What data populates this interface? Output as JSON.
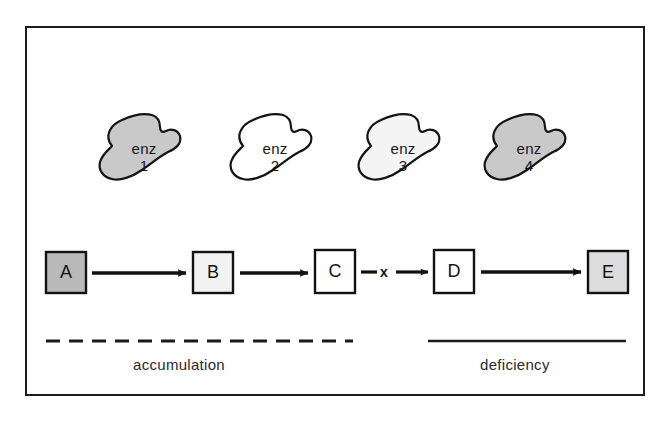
{
  "figure": {
    "type": "metabolic-pathway-diagram",
    "title": "",
    "frame": {
      "border_color": "#1c1c1c"
    }
  },
  "enzymes": [
    {
      "label": "enz",
      "number": "1",
      "fill": "#c9c9c9",
      "state": "active"
    },
    {
      "label": "enz",
      "number": "2",
      "fill": "#ffffff",
      "state": "active"
    },
    {
      "label": "enz",
      "number": "3",
      "fill": "#f4f4f4",
      "state": "deficient"
    },
    {
      "label": "enz",
      "number": "4",
      "fill": "#c9c9c9",
      "state": "active"
    }
  ],
  "metabolites": [
    {
      "label": "A",
      "fill": "#b9b9b9"
    },
    {
      "label": "B",
      "fill": "#f2f2f2"
    },
    {
      "label": "C",
      "fill": "#ffffff"
    },
    {
      "label": "D",
      "fill": "#ffffff"
    },
    {
      "label": "E",
      "fill": "#dcdcdc"
    }
  ],
  "block": {
    "symbol": "x",
    "between": "C-D"
  },
  "annotations": [
    {
      "text": "accumulation",
      "line_style": "dashed"
    },
    {
      "text": "deficiency",
      "line_style": "solid"
    }
  ],
  "colors": {
    "ink": "#1c1c1c",
    "blob_gray": "#c9c9c9",
    "blob_light": "#f4f4f4",
    "box_gray": "#b9b9b9"
  }
}
